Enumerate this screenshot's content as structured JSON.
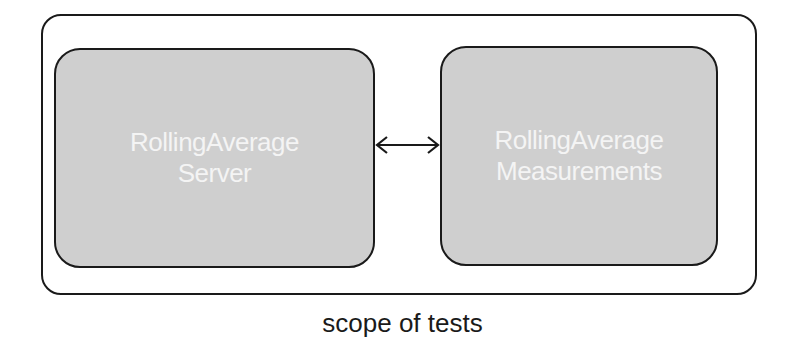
{
  "diagram": {
    "boundary": {
      "label": "scope of tests"
    },
    "nodes": [
      {
        "id": "server",
        "label_line1": "RollingAverage",
        "label_line2": "Server"
      },
      {
        "id": "measurements",
        "label_line1": "RollingAverage",
        "label_line2": "Measurements"
      }
    ],
    "edges": [
      {
        "from": "server",
        "to": "measurements",
        "type": "bidirectional-arrow"
      }
    ],
    "colors": {
      "node_fill": "#cfcfcf",
      "stroke": "#1a1a1a",
      "node_text": "#f4f4f4"
    }
  }
}
